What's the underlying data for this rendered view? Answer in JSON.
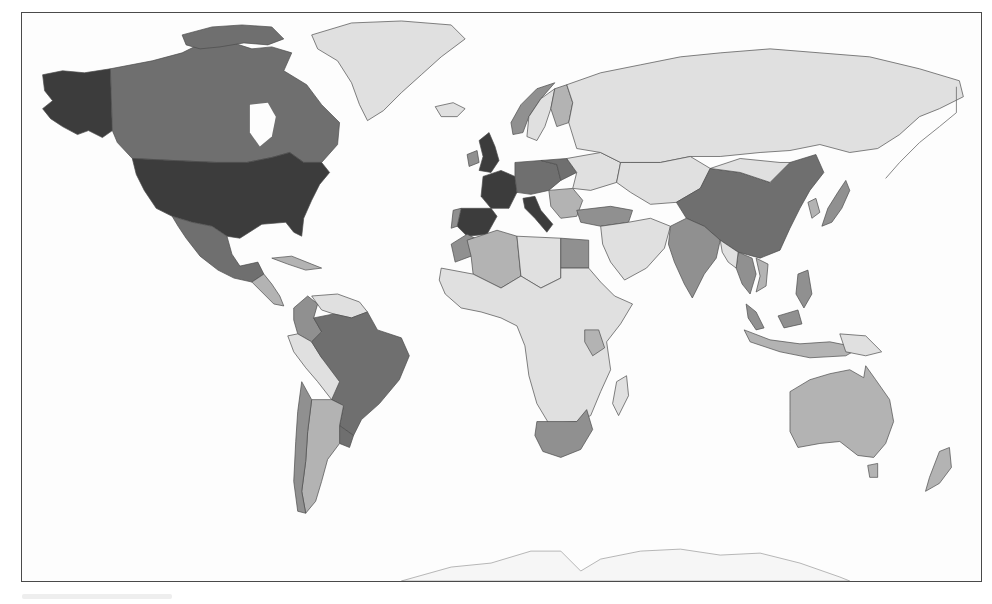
{
  "map": {
    "type": "choropleth",
    "projection": "world (Miller-like)",
    "palette": {
      "level_5_darkest": "#3c3c3c",
      "level_4_dark": "#6f6f6f",
      "level_3_medium": "#909090",
      "level_2_light": "#b3b3b3",
      "level_1_lightest": "#e0e0e0",
      "water": "#fdfdfd",
      "border": "#4d4d4d"
    },
    "regions": [
      {
        "name": "United States",
        "level": 5
      },
      {
        "name": "Alaska",
        "level": 5
      },
      {
        "name": "United Kingdom",
        "level": 5
      },
      {
        "name": "France",
        "level": 5
      },
      {
        "name": "Spain",
        "level": 5
      },
      {
        "name": "Italy",
        "level": 5
      },
      {
        "name": "Canada",
        "level": 4
      },
      {
        "name": "Mexico",
        "level": 4
      },
      {
        "name": "Germany",
        "level": 4
      },
      {
        "name": "China",
        "level": 4
      },
      {
        "name": "Brazil",
        "level": 4
      },
      {
        "name": "India",
        "level": 3
      },
      {
        "name": "Japan",
        "level": 3
      },
      {
        "name": "Thailand",
        "level": 3
      },
      {
        "name": "Colombia",
        "level": 3
      },
      {
        "name": "Chile",
        "level": 3
      },
      {
        "name": "Egypt",
        "level": 3
      },
      {
        "name": "South Africa",
        "level": 3
      },
      {
        "name": "Turkey",
        "level": 3
      },
      {
        "name": "Norway",
        "level": 3
      },
      {
        "name": "Malaysia",
        "level": 3
      },
      {
        "name": "Australia",
        "level": 2
      },
      {
        "name": "Argentina",
        "level": 2
      },
      {
        "name": "Algeria",
        "level": 2
      },
      {
        "name": "Finland",
        "level": 2
      },
      {
        "name": "Kenya",
        "level": 2
      },
      {
        "name": "New Zealand",
        "level": 2
      },
      {
        "name": "Russia",
        "level": 1
      },
      {
        "name": "Greenland",
        "level": 1
      },
      {
        "name": "Africa (other)",
        "level": 1
      },
      {
        "name": "Middle East",
        "level": 1
      },
      {
        "name": "Central Asia",
        "level": 1
      }
    ]
  },
  "caption": ""
}
